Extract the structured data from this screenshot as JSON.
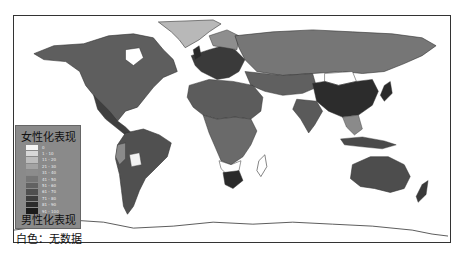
{
  "figure": {
    "type": "choropleth world map",
    "colors": {
      "background": "#ffffff",
      "frame": "#333333",
      "ocean": "#ffffff",
      "no_data": "#ffffff"
    }
  },
  "legend": {
    "title_top": "女性化表现",
    "title_bottom": "男性化表现",
    "items": [
      {
        "label": "0",
        "color": "#f5f5f5"
      },
      {
        "label": "1 - 10",
        "color": "#d8d8d8"
      },
      {
        "label": "11 - 20",
        "color": "#bdbdbd"
      },
      {
        "label": "21 - 30",
        "color": "#a3a3a3"
      },
      {
        "label": "31 - 40",
        "color": "#8c8c8c"
      },
      {
        "label": "41 - 50",
        "color": "#767676"
      },
      {
        "label": "51 - 60",
        "color": "#626262"
      },
      {
        "label": "61 - 70",
        "color": "#4f4f4f"
      },
      {
        "label": "71 - 80",
        "color": "#3d3d3d"
      },
      {
        "label": "81 - 90",
        "color": "#2c2c2c"
      },
      {
        "label": "91 - 100",
        "color": "#1b1b1b"
      }
    ]
  },
  "note": "白色：无数据"
}
